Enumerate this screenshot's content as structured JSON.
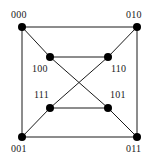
{
  "figure": {
    "name": "hypercube-q3-graph",
    "type": "graph-diagram",
    "width": 158,
    "height": 163,
    "background_color": "#ffffff",
    "edge_color": "#1a1a1a",
    "vertex_color": "#000000",
    "label_color": "#1a1a1a",
    "edge_width": 1,
    "vertex_radius": 4
  },
  "nodes": [
    {
      "id": "000",
      "label": "000",
      "x": 22,
      "y": 27,
      "label_x": 11,
      "label_y": 10,
      "ring": "outer",
      "corner": "top-left"
    },
    {
      "id": "010",
      "label": "010",
      "x": 137,
      "y": 27,
      "label_x": 126,
      "label_y": 10,
      "ring": "outer",
      "corner": "top-right"
    },
    {
      "id": "001",
      "label": "001",
      "x": 22,
      "y": 137,
      "label_x": 11,
      "label_y": 144,
      "ring": "outer",
      "corner": "bottom-left"
    },
    {
      "id": "011",
      "label": "011",
      "x": 137,
      "y": 137,
      "label_x": 126,
      "label_y": 144,
      "ring": "outer",
      "corner": "bottom-right"
    },
    {
      "id": "100",
      "label": "100",
      "x": 50,
      "y": 57,
      "label_x": 32,
      "label_y": 64,
      "ring": "inner",
      "corner": "top-left"
    },
    {
      "id": "110",
      "label": "110",
      "x": 108,
      "y": 57,
      "label_x": 111,
      "label_y": 64,
      "ring": "inner",
      "corner": "top-right"
    },
    {
      "id": "111",
      "label": "111",
      "x": 50,
      "y": 108,
      "label_x": 34,
      "label_y": 90,
      "ring": "inner",
      "corner": "bottom-left"
    },
    {
      "id": "101",
      "label": "101",
      "x": 108,
      "y": 108,
      "label_x": 110,
      "label_y": 90,
      "ring": "inner",
      "corner": "bottom-right"
    }
  ],
  "edges": [
    {
      "from": "000",
      "to": "010",
      "kind": "outer-top"
    },
    {
      "from": "000",
      "to": "001",
      "kind": "outer-left"
    },
    {
      "from": "010",
      "to": "011",
      "kind": "outer-right"
    },
    {
      "from": "001",
      "to": "011",
      "kind": "outer-bottom"
    },
    {
      "from": "100",
      "to": "110",
      "kind": "inner-top"
    },
    {
      "from": "111",
      "to": "101",
      "kind": "inner-bottom"
    },
    {
      "from": "000",
      "to": "100",
      "kind": "diagonal-corner"
    },
    {
      "from": "010",
      "to": "110",
      "kind": "diagonal-corner"
    },
    {
      "from": "001",
      "to": "111",
      "kind": "diagonal-corner"
    },
    {
      "from": "011",
      "to": "101",
      "kind": "diagonal-corner"
    },
    {
      "from": "100",
      "to": "101",
      "kind": "crossing-diagonal"
    },
    {
      "from": "110",
      "to": "111",
      "kind": "crossing-diagonal"
    }
  ]
}
